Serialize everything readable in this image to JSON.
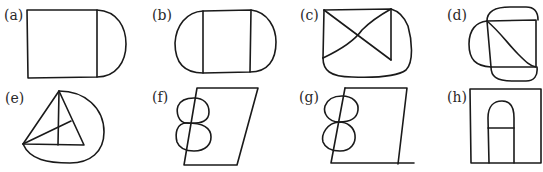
{
  "figure": {
    "panels": [
      {
        "id": "a",
        "label": "(a)",
        "description": "square with semicircular cap on the right"
      },
      {
        "id": "b",
        "label": "(b)",
        "description": "rectangle with semicircular caps on left and right"
      },
      {
        "id": "c",
        "label": "(c)",
        "description": "rectangle with crossed diagonals and curved bottom-right enclosure"
      },
      {
        "id": "d",
        "label": "(d)",
        "description": "square with one diagonal and arcs on top, bottom and left"
      },
      {
        "id": "e",
        "label": "(e)",
        "description": "triangle with two internal lines inside a rounded enclosure"
      },
      {
        "id": "f",
        "label": "(f)",
        "description": "parallelogram with figure-eight on left edge"
      },
      {
        "id": "g",
        "label": "(g)",
        "description": "parallelogram with figure-eight on left edge and extended baseline"
      },
      {
        "id": "h",
        "label": "(h)",
        "description": "square with arched doorway shape and horizontal bar"
      }
    ],
    "colors": {
      "stroke": "#1a1a1a",
      "background": "#ffffff"
    }
  }
}
